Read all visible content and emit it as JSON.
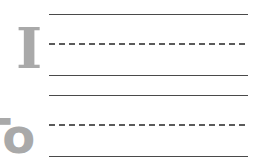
{
  "worksheet": {
    "rows": [
      {
        "letter": "I",
        "lines": [
          "solid",
          "dashed",
          "solid"
        ]
      },
      {
        "letter": "To",
        "lines": [
          "solid",
          "dashed",
          "solid"
        ]
      }
    ]
  },
  "colors": {
    "letter": "#a9a9a9",
    "line": "#4a4a4a",
    "background": "#ffffff"
  }
}
